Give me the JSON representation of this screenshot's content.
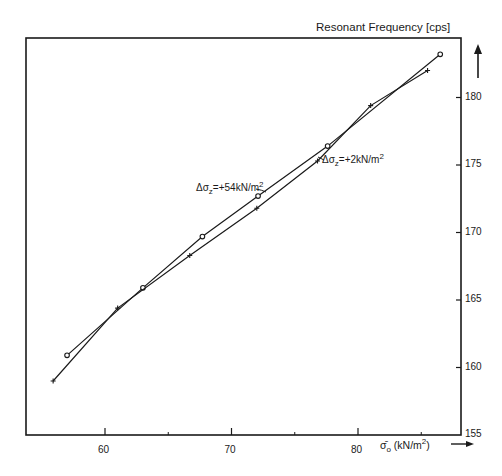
{
  "chart_data": {
    "type": "line",
    "title": "",
    "ylabel": "Resonant  Frequency [cps]",
    "xlabel": "σ̄o (kN/m²)",
    "xlim": [
      53,
      88
    ],
    "ylim": [
      155,
      184
    ],
    "x_ticks": [
      60,
      70,
      80
    ],
    "x_minor_ticks": [
      65,
      75,
      85
    ],
    "y_ticks": [
      155,
      160,
      165,
      170,
      175,
      180
    ],
    "grid": false,
    "legend": "inline annotations",
    "series": [
      {
        "name": "Δσz = +54kN/m²",
        "marker": "circle",
        "x": [
          57.0,
          63.0,
          67.7,
          72.1,
          77.6,
          86.5
        ],
        "y": [
          160.9,
          165.9,
          169.7,
          172.7,
          176.4,
          183.2
        ]
      },
      {
        "name": "Δσz = +2kN/m²",
        "marker": "plus",
        "x": [
          55.9,
          61.0,
          66.7,
          72.0,
          76.8,
          81.0,
          85.5
        ],
        "y": [
          159.0,
          164.4,
          168.3,
          171.8,
          175.3,
          179.4,
          182.0
        ]
      }
    ],
    "annotations": [
      {
        "text": "Δσz = +54kN/m²",
        "points_to_series": 0
      },
      {
        "text": "Δσz = +2kN/m²",
        "points_to_series": 1
      }
    ]
  },
  "labels": {
    "y_axis_title": "Resonant  Frequency [cps]",
    "x_axis_title_sym": "σ̄",
    "x_axis_title_sub": "o",
    "x_axis_title_unit": "(kN/m",
    "x_axis_title_sup": "2",
    "x_axis_title_end": ")",
    "ann1_prefix": "Δσ",
    "ann1_sub": "z",
    "ann1_text": "=+54kN/m",
    "ann1_sup": "2",
    "ann2_prefix": "Δσ",
    "ann2_sub": "z",
    "ann2_text": "=+2kN/m",
    "ann2_sup": "2"
  }
}
